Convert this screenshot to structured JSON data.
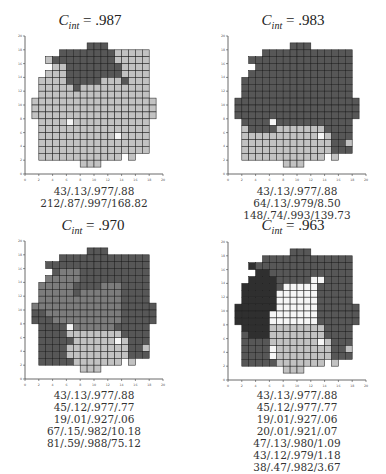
{
  "figure": {
    "legend": {
      "L": "#c2c2c2",
      "D": "#575757",
      "K": "#2f2f2f",
      "M": "#7c7c7c",
      "W": "#f6f6f6"
    },
    "axis": {
      "min": 0,
      "max": 20,
      "tick_step": 2,
      "tick_labels": [
        "0",
        "2",
        "4",
        "6",
        "8",
        "10",
        "12",
        "14",
        "16",
        "18",
        "20"
      ]
    },
    "panels": [
      {
        "title_prefix": "C",
        "title_sub": "int",
        "title_value": "= .987",
        "origin": [
          25,
          174
        ],
        "title_pos": [
          90,
          24
        ],
        "caption_top": 185,
        "captions": [
          "43/.13/.977/.88",
          "212/.87/.997/168.82"
        ]
      },
      {
        "title_prefix": "C",
        "title_sub": "int",
        "title_value": "= .983",
        "origin": [
          228,
          174
        ],
        "title_pos": [
          293,
          24
        ],
        "caption_top": 185,
        "captions": [
          "43/.13/.977/.88",
          "64/.13/.979/8.50",
          "148/.74/.993/139.73"
        ]
      },
      {
        "title_prefix": "C",
        "title_sub": "int",
        "title_value": "= .970",
        "origin": [
          25,
          379
        ],
        "title_pos": [
          93,
          229
        ],
        "caption_top": 389,
        "captions": [
          "43/.13/.977/.88",
          "45/.12/.977/.77",
          "19/.01/.927/.06",
          "67/.15/.982/10.18",
          "81/.59/.988/75.12"
        ]
      },
      {
        "title_prefix": "C",
        "title_sub": "int",
        "title_value": "= .963",
        "origin": [
          228,
          380
        ],
        "title_pos": [
          293,
          229
        ],
        "caption_top": 389,
        "captions": [
          "43/.13/.977/.88",
          "45/.12/.977/.77",
          "19/.01/.927/.06",
          "20/.01/.921/.07",
          "47/.13/.980/1.09",
          "43/.12/.979/1.18",
          "38/.47/.982/3.67"
        ]
      }
    ]
  },
  "chart_data": [
    {
      "type": "heatmap",
      "title": "C_int = .987",
      "xlim": [
        0,
        20
      ],
      "ylim": [
        0,
        20
      ],
      "annotations": [
        "43/.13/.977/.88",
        "212/.87/.997/168.82"
      ],
      "rows_top_to_bottom_y18_to_y1": [
        ".........DDD........",
        ".....DDDDDDDDLLLLL..",
        "...LDDDDDDDDDLLLLL..",
        "....LLDDDDDDDDLLLL..",
        "...LLLDDDDDDDDLLLL..",
        "..LLLLDDDDDLLLDLLL..",
        "..LLLLLDLLLLLLLLLL..",
        "..LLLLLLLLLLLLLLLL..",
        ".LLLLLLLLLLLLLLLLLL.",
        ".LLLLLLLLLLLLLLLLLL.",
        ".LLLLLLLLLLLLLLLLLL.",
        "..LLLLWLLLLLLLLLLL..",
        "..LLLLLLLLLLLLLLLL..",
        "..LLLLLLLLLLLWLLLL..",
        "..LLLLLLLLLLLLLLLL..",
        "..LLLLLLLLLLLLLLLL..",
        "..LLLLLLLLLLLL.L....",
        "........LLL........."
      ]
    },
    {
      "type": "heatmap",
      "title": "C_int = .983",
      "xlim": [
        0,
        20
      ],
      "ylim": [
        0,
        20
      ],
      "annotations": [
        "43/.13/.977/.88",
        "64/.13/.979/8.50",
        "148/.74/.993/139.73"
      ],
      "rows_top_to_bottom_y18_to_y1": [
        ".........DDD........",
        ".....DDDDDDDDDDDDD..",
        "...DDDDDDDDDDDDDDD..",
        "....DDDDDDDDDDDDDD..",
        "...DDDDDDDDDDDDDDD..",
        "..DDDDDDDDDDDDDDDD..",
        "..DDDDDDDDDDDDDDDD..",
        "..DDDDDDDDDDDDDDDD..",
        ".DDDDDDDDDDDDDDDDDD.",
        ".DDDDDDDDDDDDDDDDDD.",
        ".DDDDDDDDDDDDDDDDDD.",
        "..DDDDWDDDDDDDDDDD..",
        "..LDDDDLLLLLLLDDDD..",
        "..LLLLLLLLLLLWLDDD..",
        "..LLLLLLLLLLLLLDDL..",
        "..LLLLLLLLLLLLLDDD..",
        "..LLLLLLLLLLLL.L....",
        "........LLL........."
      ]
    },
    {
      "type": "heatmap",
      "title": "C_int = .970",
      "xlim": [
        0,
        20
      ],
      "ylim": [
        0,
        20
      ],
      "annotations": [
        "43/.13/.977/.88",
        "45/.12/.977/.77",
        "19/.01/.927/.06",
        "67/.15/.982/10.18",
        "81/.59/.988/75.12"
      ],
      "rows_top_to_bottom_y18_to_y1": [
        ".........DDD........",
        ".....DDDDDDDDDDDDD..",
        "...DDDDDDDDDDDDDDD..",
        "....DMMMDDDDDDDDDD..",
        "...MMMMMDDDDDDDDDD..",
        "..MMMMMDDDDMMMDDDD..",
        "..MMMMMDMMMMMMDDDD..",
        "..MMMMMMMMMMMMDDDD..",
        ".MMMMMMMMMMMMMDDDDD.",
        ".DDMMMMMMMMMMMDDDDD.",
        ".DDDMMMMMMMMMMDDDDD.",
        "..DDDDWMMMMMMDDDDD..",
        "..DDDDLLLLLLLLDDDD..",
        "..DDDDDLLLLLLWLDDD..",
        "..DDDDLLLLLLLLLDDL..",
        "..DDDDLLLLLLLLLDDD..",
        "..DDDDDLLLLLLL.L....",
        "........LLL........."
      ]
    },
    {
      "type": "heatmap",
      "title": "C_int = .963",
      "xlim": [
        0,
        20
      ],
      "ylim": [
        0,
        20
      ],
      "annotations": [
        "43/.13/.977/.88",
        "45/.12/.977/.77",
        "19/.01/.927/.06",
        "20/.01/.921/.07",
        "47/.13/.980/1.09",
        "43/.12/.979/1.18",
        "38/.47/.982/3.67"
      ],
      "rows_top_to_bottom_y18_to_y1": [
        ".........DDD........",
        ".....DDDDDDDDDDDDD..",
        "...KDDDDDDDDDDDDDD..",
        "....KKDDDDDDDDDDDD..",
        "...KKKKDDDDDWWDDDD..",
        "..KKKKKDWWWWWDDDDD..",
        "..KKKKKWWWWWWDDDDD..",
        "..KKKKKWWWWWWDDDDD..",
        ".KKKKKKWWWWWWDDDDDD.",
        ".KKKKKWWWWWWWDDDDDD.",
        ".KKKKKWWWWWWWDDDDDD.",
        "..KKKKLLLLLLLLDDDD..",
        "..DKKKLLLLLLLLDDDD..",
        "..DDDDLLLLLLLWLDDD..",
        "..DDDDWLLLLLLLLDDL..",
        "..DDDDWLLLLLLLLDDD..",
        "..DDDDDLLLLLLL.L....",
        "........LLL........."
      ]
    }
  ]
}
